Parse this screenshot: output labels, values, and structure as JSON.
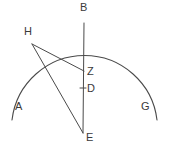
{
  "figure": {
    "kind": "geometry-diagram",
    "background_color": "#ffffff",
    "stroke_color": "#4a4a4a",
    "label_color": "#3a3a3a",
    "canvas": {
      "width": 170,
      "height": 152
    }
  },
  "labels": [
    {
      "id": "B",
      "text": "B",
      "x": 80,
      "y": 2
    },
    {
      "id": "H",
      "text": "H",
      "x": 24,
      "y": 26
    },
    {
      "id": "Z",
      "text": "Z",
      "x": 87,
      "y": 66
    },
    {
      "id": "D",
      "text": "D",
      "x": 87,
      "y": 83
    },
    {
      "id": "A",
      "text": "A",
      "x": 15,
      "y": 101
    },
    {
      "id": "G",
      "text": "G",
      "x": 141,
      "y": 101
    },
    {
      "id": "E",
      "text": "E",
      "x": 86,
      "y": 132
    }
  ],
  "points": [
    {
      "id": "B",
      "x": 84,
      "y": 23
    },
    {
      "id": "H",
      "x": 32,
      "y": 44
    },
    {
      "id": "Z",
      "x": 84,
      "y": 71
    },
    {
      "id": "D",
      "x": 84,
      "y": 88
    },
    {
      "id": "E",
      "x": 83,
      "y": 133
    },
    {
      "id": "A",
      "x": 12,
      "y": 120
    },
    {
      "id": "G",
      "x": 157,
      "y": 120
    }
  ],
  "arc": {
    "id": "arc-A-B-G",
    "path": "M 12 120 A 73 73 0 0 1 157 120",
    "from": "A",
    "apex": "B",
    "to": "G"
  },
  "segments": [
    {
      "id": "segment-B-E",
      "from": "B",
      "to": "E",
      "path": "M 84 23 L 83 133"
    },
    {
      "id": "segment-H-Z",
      "from": "H",
      "to": "Z",
      "path": "M 32 44 L 84 71"
    },
    {
      "id": "segment-H-E",
      "from": "H",
      "to": "E",
      "path": "M 32 44 L 83 133"
    }
  ],
  "ticks": [
    {
      "id": "tick-D",
      "at": "D",
      "path": "M 80 88 L 86 88"
    }
  ]
}
